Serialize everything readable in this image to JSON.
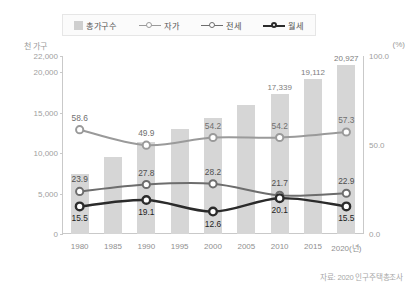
{
  "legend": {
    "items": [
      {
        "label": "총가구수",
        "marker": "bar-swatch",
        "color": "#cfcfcf"
      },
      {
        "label": "자가",
        "marker": "line-marker",
        "color": "#9a9a9a"
      },
      {
        "label": "전세",
        "marker": "line-marker",
        "color": "#6d6d6d"
      },
      {
        "label": "월세",
        "marker": "line-marker",
        "color": "#2b2b2b"
      }
    ]
  },
  "axis": {
    "left_unit": "천 가구",
    "right_unit": "(%)",
    "left_ticks": [
      "22,000",
      "20,000",
      "15,000",
      "10,000",
      "5,000",
      "0"
    ],
    "right_ticks": [
      "100.0",
      "50.0",
      "0.0"
    ]
  },
  "source_note": "자료: 2020 인구주택총조사",
  "x_labels": [
    "1980",
    "1985",
    "1990",
    "1995",
    "2000",
    "2005",
    "2010",
    "2015",
    "2020(년)"
  ],
  "bar_labels": {
    "b2010": "17,339",
    "b2015": "19,112",
    "b2020": "20,927"
  },
  "point_labels": {
    "jaga": [
      "58.6",
      "49.9",
      "54.2",
      "54.2",
      "57.3"
    ],
    "jeonse": [
      "23.9",
      "27.8",
      "28.2",
      "21.7",
      "22.9"
    ],
    "wolse": [
      "15.5",
      "19.1",
      "12.6",
      "20.1",
      "15.5"
    ]
  },
  "chart_data": {
    "type": "bar",
    "title": "",
    "xlabel": "",
    "ylabel": "천 가구",
    "y2label": "(%)",
    "ylim": [
      0,
      22000
    ],
    "y2lim": [
      0,
      100
    ],
    "grid": false,
    "legend_position": "top",
    "categories": [
      "1980",
      "1985",
      "1990",
      "1995",
      "2000",
      "2005",
      "2010",
      "2015",
      "2020"
    ],
    "series": [
      {
        "name": "총가구수",
        "type": "bar",
        "axis": "left",
        "unit": "천 가구",
        "color": "#d6d6d6",
        "values": [
          7470,
          9571,
          11355,
          12958,
          14312,
          15887,
          17339,
          19112,
          20927
        ],
        "labeled_values": {
          "2010": 17339,
          "2015": 19112,
          "2020": 20927
        }
      },
      {
        "name": "자가",
        "type": "line",
        "axis": "right",
        "unit": "%",
        "color": "#9a9a9a",
        "x": [
          "1980",
          "1990",
          "2000",
          "2010",
          "2020"
        ],
        "values": [
          58.6,
          49.9,
          54.2,
          54.2,
          57.3
        ]
      },
      {
        "name": "전세",
        "type": "line",
        "axis": "right",
        "unit": "%",
        "color": "#6d6d6d",
        "x": [
          "1980",
          "1990",
          "2000",
          "2010",
          "2020"
        ],
        "values": [
          23.9,
          27.8,
          28.2,
          21.7,
          22.9
        ]
      },
      {
        "name": "월세",
        "type": "line",
        "axis": "right",
        "unit": "%",
        "color": "#2b2b2b",
        "x": [
          "1980",
          "1990",
          "2000",
          "2010",
          "2020"
        ],
        "values": [
          15.5,
          19.1,
          12.6,
          20.1,
          15.5
        ]
      }
    ]
  }
}
